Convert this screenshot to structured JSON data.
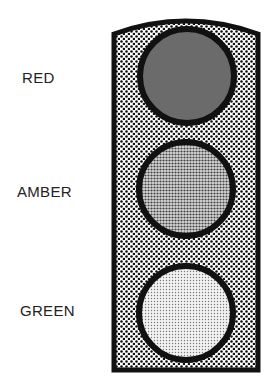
{
  "diagram": {
    "lights": [
      {
        "label": "RED",
        "fill": "#6e6e6e"
      },
      {
        "label": "AMBER",
        "fill": "#c8c8c8"
      },
      {
        "label": "GREEN",
        "fill": "#f0f0f0"
      }
    ],
    "housing_fill": "#e8e8e8",
    "outline": "#111111"
  }
}
